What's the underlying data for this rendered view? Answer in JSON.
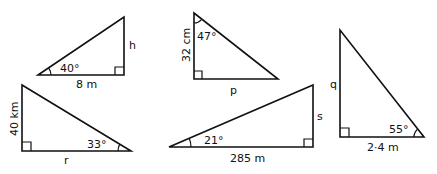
{
  "diagram": {
    "triangles": [
      {
        "id": "t1",
        "vertices": [
          [
            38,
            75
          ],
          [
            124,
            17
          ],
          [
            124,
            75
          ]
        ],
        "right_angle_at": [
          124,
          75
        ],
        "angle": {
          "label": "40°",
          "at": "left"
        },
        "sides": {
          "base": "8 m",
          "vertical": "h"
        }
      },
      {
        "id": "t2",
        "vertices": [
          [
            194,
            13
          ],
          [
            194,
            79
          ],
          [
            278,
            79
          ]
        ],
        "right_angle_at": [
          194,
          79
        ],
        "angle": {
          "label": "47°",
          "at": "top"
        },
        "sides": {
          "vertical": "32 cm",
          "base": "p"
        }
      },
      {
        "id": "t3",
        "vertices": [
          [
            22,
            85
          ],
          [
            22,
            151
          ],
          [
            131,
            151
          ]
        ],
        "right_angle_at": [
          22,
          151
        ],
        "angle": {
          "label": "33°",
          "at": "right"
        },
        "sides": {
          "vertical": "40 km",
          "base": "r"
        }
      },
      {
        "id": "t4",
        "vertices": [
          [
            169,
            147
          ],
          [
            313,
            85
          ],
          [
            313,
            147
          ]
        ],
        "right_angle_at": [
          313,
          147
        ],
        "angle": {
          "label": "21°",
          "at": "left"
        },
        "sides": {
          "base": "285 m",
          "vertical": "s"
        }
      },
      {
        "id": "t5",
        "vertices": [
          [
            340,
            30
          ],
          [
            340,
            137
          ],
          [
            424,
            137
          ]
        ],
        "right_angle_at": [
          340,
          137
        ],
        "angle": {
          "label": "55°",
          "at": "right"
        },
        "sides": {
          "vertical": "q",
          "base": "2·4 m"
        }
      }
    ]
  }
}
